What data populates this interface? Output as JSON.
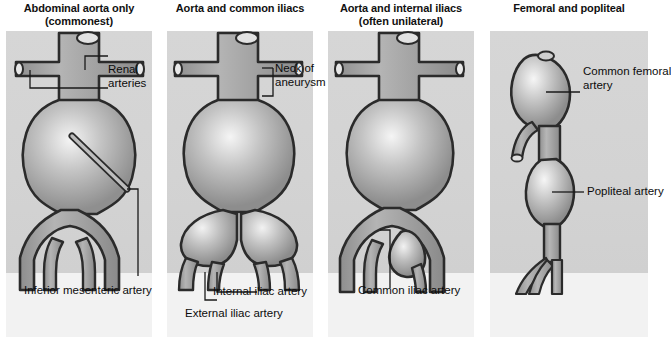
{
  "figure": {
    "type": "medical-illustration",
    "panel_count": 4
  },
  "colors": {
    "page_background": "#ffffff",
    "panel_background": "#d3d3d3",
    "panel_lower_background": "#f2f2f2",
    "vessel_fill": "#9a9a9a",
    "vessel_outline": "#2b2b2b",
    "aneurysm_highlight": "#efefef",
    "label_text": "#0c0c0c",
    "leader_line": "#1a1a1a"
  },
  "panels": [
    {
      "id": "panel-abdominal-aorta-only",
      "title_line1": "Abdominal aorta only",
      "title_line2": "(commonest)",
      "labels": [
        {
          "id": "renal-arteries",
          "line1": "Renal",
          "line2": "arteries"
        },
        {
          "id": "inferior-mesenteric-artery",
          "line1": "Inferior mesenteric artery",
          "line2": ""
        }
      ]
    },
    {
      "id": "panel-aorta-and-common-iliacs",
      "title_line1": "Aorta and common iliacs",
      "title_line2": "",
      "labels": [
        {
          "id": "neck-of-aneurysm",
          "line1": "Neck of",
          "line2": "aneurysm"
        },
        {
          "id": "internal-iliac-artery",
          "line1": "Internal iliac artery",
          "line2": ""
        },
        {
          "id": "external-iliac-artery",
          "line1": "External iliac artery",
          "line2": ""
        }
      ]
    },
    {
      "id": "panel-aorta-and-internal-iliacs",
      "title_line1": "Aorta and internal iliacs",
      "title_line2": "(often unilateral)",
      "labels": [
        {
          "id": "common-iliac-artery",
          "line1": "Common iliac artery",
          "line2": ""
        }
      ]
    },
    {
      "id": "panel-femoral-and-popliteal",
      "title_line1": "Femoral and popliteal",
      "title_line2": "",
      "labels": [
        {
          "id": "common-femoral-artery",
          "line1": "Common femoral",
          "line2": "artery"
        },
        {
          "id": "popliteal-artery",
          "line1": "Popliteal artery",
          "line2": ""
        }
      ]
    }
  ]
}
